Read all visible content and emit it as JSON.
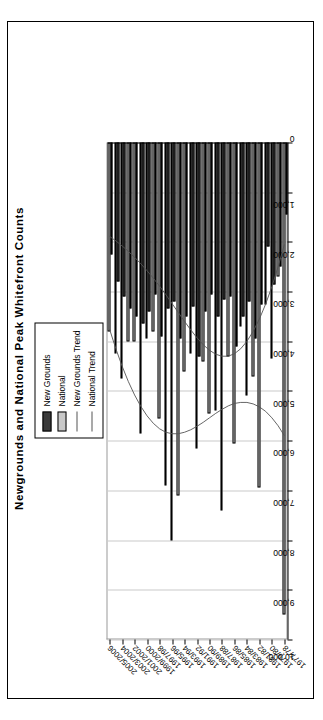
{
  "chart_data": {
    "type": "bar",
    "orientation": "horizontal",
    "title": "Newgrounds and National Peak Whitefront Counts",
    "xlabel": "",
    "ylabel": "",
    "value_axis": {
      "min": 0,
      "max": 10000,
      "step": 1000,
      "tick_labels": [
        "0",
        "1,000",
        "2,000",
        "3,000",
        "4,000",
        "5,000",
        "6,000",
        "7,000",
        "8,000",
        "9,000",
        "10,000"
      ],
      "direction": "right-to-left"
    },
    "grid": true,
    "legend_position": "top-right",
    "legend": [
      "New Grounds",
      "National",
      "New Grounds Trend",
      "National Trend"
    ],
    "categories": [
      "1977/78",
      "1978/79",
      "1979/80",
      "1980/81",
      "1981/82",
      "1982/83",
      "1983/84",
      "1984/85",
      "1985/86",
      "1986/87",
      "1987/88",
      "1988/89",
      "1989/90",
      "1990/91",
      "1991/92",
      "1992/93",
      "1993/94",
      "1994/95",
      "1995/96",
      "1996/97",
      "1997/98",
      "1998/99",
      "1999/2000",
      "2000/2001",
      "2001/2002",
      "2002/2003",
      "2003/2004",
      "2004/2005",
      "2005/2006"
    ],
    "axis_tick_labels": [
      "1977/78",
      "1979/80",
      "1981/82",
      "1983/84",
      "1985/86",
      "1987/88",
      "1989/90",
      "1991/92",
      "1993/94",
      "1995/96",
      "1997/98",
      "1999/2000",
      "2001/2002",
      "2003/2004",
      "2005/2006"
    ],
    "series": [
      {
        "name": "New Grounds",
        "color": "#3b3b3b",
        "values": [
          1450,
          2500,
          2850,
          2100,
          3250,
          3950,
          3200,
          3500,
          4100,
          3100,
          3150,
          3500,
          3050,
          3400,
          4300,
          3300,
          3500,
          3950,
          3200,
          3350,
          3900,
          3050,
          3400,
          3650,
          3500,
          3350,
          3100,
          2800,
          2250
        ]
      },
      {
        "name": "National",
        "color": "#c8c8c8",
        "values": [
          9500,
          2700,
          4350,
          3250,
          6950,
          4700,
          5100,
          3700,
          6050,
          4300,
          7400,
          5400,
          5450,
          4400,
          6150,
          4250,
          4600,
          7100,
          8000,
          6900,
          5550,
          3800,
          3950,
          5850,
          4000,
          4000,
          4750,
          4250,
          3800
        ]
      }
    ],
    "trend_lines": [
      {
        "name": "New Grounds Trend",
        "color": "#555555",
        "points": [
          2050,
          2500,
          2900,
          3250,
          3550,
          3800,
          4000,
          4150,
          4250,
          4300,
          4300,
          4260,
          4180,
          4070,
          3930,
          3770,
          3600,
          3420,
          3240,
          3060,
          2890,
          2730,
          2580,
          2440,
          2310,
          2190,
          2080,
          1980,
          1890
        ]
      },
      {
        "name": "National Trend",
        "color": "#555555",
        "points": [
          5900,
          5700,
          5540,
          5410,
          5320,
          5260,
          5230,
          5230,
          5250,
          5300,
          5370,
          5450,
          5540,
          5630,
          5710,
          5780,
          5830,
          5860,
          5860,
          5830,
          5760,
          5650,
          5500,
          5310,
          5080,
          4810,
          4500,
          4150,
          3760
        ]
      }
    ]
  }
}
